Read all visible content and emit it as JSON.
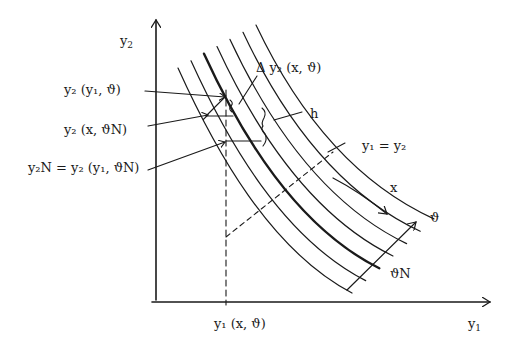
{
  "diagram": {
    "type": "contour-chart",
    "axes": {
      "x_label": "y₁",
      "y_label": "y₂"
    },
    "labels": {
      "y2_y1_theta": "y₂ (y₁, ϑ)",
      "y2_x_thetaN": "y₂ (x, ϑN)",
      "y2N": "y₂N = y₂ (y₁, ϑN)",
      "delta_y2": "Δ y₂ (x, ϑ)",
      "h": "h",
      "diagonal": "y₁ =  y₂",
      "x_direction": "x",
      "theta_direction": "ϑ",
      "theta_N": "ϑN",
      "y1_x_theta": "y₁ (x, ϑ)"
    },
    "curve_count": 7,
    "highlighted_curve_index": 2,
    "colors": {
      "ink": "#1a1a1a",
      "background": "#ffffff"
    }
  }
}
